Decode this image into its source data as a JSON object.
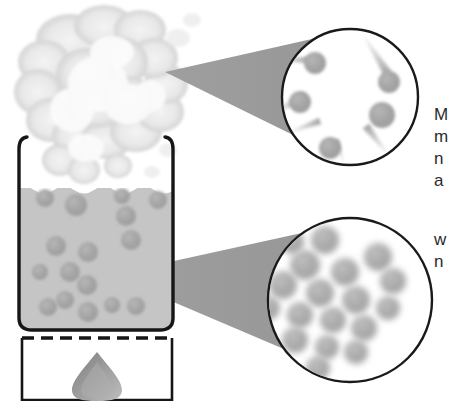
{
  "figure": {
    "type": "science-illustration"
  },
  "colors": {
    "outline": "#161616",
    "liquid_fill": "#c9c9c9",
    "liquid_fill_dark": "#bcbcbc",
    "particle": "#a6a6a6",
    "particle_dark": "#9a9a9a",
    "cone_fill": "#9b9b9b",
    "steam": "#e4e4e4",
    "steam_edge": "#cfcfcf",
    "flame": "#8e8e8e",
    "flame_light": "#b5b5b5",
    "circle_stroke": "#1a1a1a",
    "text": "#2b2b2b"
  },
  "apparatus": {
    "beaker": {
      "label": "beaker",
      "liquid_level_label": "liquid surface"
    },
    "steam_cloud": {
      "label": "steam cloud"
    },
    "heat_source": {
      "label": "heat source",
      "flame_label": "flame"
    },
    "dashed_line": {
      "label": "hot plate surface"
    }
  },
  "callouts": [
    {
      "id": "gas",
      "label": "gas-phase magnification",
      "circle": {
        "cx": 350,
        "cy": 97,
        "r": 68
      },
      "cone": {
        "apex_x": 165,
        "apex_y": 72
      },
      "particles": [
        {
          "x": 315,
          "y": 63,
          "r": 11
        },
        {
          "x": 300,
          "y": 102,
          "r": 11
        },
        {
          "x": 389,
          "y": 82,
          "r": 11
        },
        {
          "x": 382,
          "y": 115,
          "r": 13
        },
        {
          "x": 330,
          "y": 148,
          "r": 11
        }
      ],
      "trails": [
        {
          "x1": 268,
          "y1": 60,
          "x2": 309,
          "y2": 60,
          "w": 7
        },
        {
          "x1": 262,
          "y1": 118,
          "x2": 305,
          "y2": 97,
          "w": 9
        },
        {
          "x1": 360,
          "y1": 30,
          "x2": 388,
          "y2": 74,
          "w": 9
        },
        {
          "x1": 282,
          "y1": 135,
          "x2": 320,
          "y2": 121,
          "w": 7
        },
        {
          "x1": 392,
          "y1": 160,
          "x2": 366,
          "y2": 126,
          "w": 8
        },
        {
          "x1": 345,
          "y1": 166,
          "x2": 336,
          "y2": 140,
          "w": 6
        }
      ]
    },
    {
      "id": "liquid",
      "label": "liquid-phase magnification",
      "circle": {
        "cx": 350,
        "cy": 300,
        "r": 82
      },
      "cone": {
        "apex_x": 110,
        "apex_y": 275
      },
      "particles": [
        {
          "x": 325,
          "y": 240,
          "r": 14
        },
        {
          "x": 292,
          "y": 242,
          "r": 12
        },
        {
          "x": 305,
          "y": 265,
          "r": 15
        },
        {
          "x": 345,
          "y": 272,
          "r": 14
        },
        {
          "x": 378,
          "y": 257,
          "r": 14
        },
        {
          "x": 393,
          "y": 281,
          "r": 13
        },
        {
          "x": 283,
          "y": 285,
          "r": 14
        },
        {
          "x": 320,
          "y": 293,
          "r": 14
        },
        {
          "x": 356,
          "y": 300,
          "r": 14
        },
        {
          "x": 388,
          "y": 308,
          "r": 12
        },
        {
          "x": 300,
          "y": 315,
          "r": 13
        },
        {
          "x": 333,
          "y": 320,
          "r": 13
        },
        {
          "x": 364,
          "y": 328,
          "r": 13
        },
        {
          "x": 295,
          "y": 340,
          "r": 13
        },
        {
          "x": 327,
          "y": 347,
          "r": 12
        },
        {
          "x": 356,
          "y": 352,
          "r": 12
        },
        {
          "x": 318,
          "y": 368,
          "r": 12
        },
        {
          "x": 268,
          "y": 308,
          "r": 12
        }
      ]
    }
  ],
  "annotations": {
    "upper_text": "M\nm\nn\na",
    "lower_text": "w\nn"
  },
  "liquid_particles": [
    {
      "x": 45,
      "y": 198,
      "r": 9
    },
    {
      "x": 76,
      "y": 205,
      "r": 11
    },
    {
      "x": 122,
      "y": 196,
      "r": 8
    },
    {
      "x": 158,
      "y": 200,
      "r": 9
    },
    {
      "x": 126,
      "y": 216,
      "r": 10
    },
    {
      "x": 56,
      "y": 246,
      "r": 10
    },
    {
      "x": 88,
      "y": 252,
      "r": 10
    },
    {
      "x": 131,
      "y": 240,
      "r": 10
    },
    {
      "x": 40,
      "y": 272,
      "r": 8
    },
    {
      "x": 70,
      "y": 272,
      "r": 10
    },
    {
      "x": 87,
      "y": 285,
      "r": 10
    },
    {
      "x": 65,
      "y": 300,
      "r": 9
    },
    {
      "x": 88,
      "y": 312,
      "r": 10
    },
    {
      "x": 48,
      "y": 307,
      "r": 9
    },
    {
      "x": 112,
      "y": 305,
      "r": 8
    },
    {
      "x": 136,
      "y": 306,
      "r": 9
    }
  ]
}
